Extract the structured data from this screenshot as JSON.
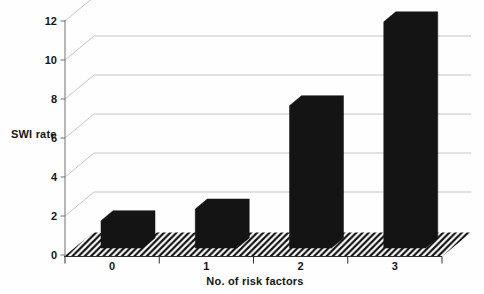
{
  "chart_data": {
    "type": "bar",
    "effect": "3d-oblique",
    "title": "",
    "xlabel": "No. of risk factors",
    "ylabel": "SWI rate",
    "categories": [
      "0",
      "1",
      "2",
      "3"
    ],
    "values": [
      1.4,
      2.0,
      7.3,
      11.6
    ],
    "ylim": [
      0,
      12
    ],
    "yticks": [
      0,
      2,
      4,
      6,
      8,
      10,
      12
    ],
    "y_tick_labels": [
      "0",
      "2",
      "4",
      "6",
      "8",
      "10",
      "12"
    ],
    "grid": "on",
    "legend": "none",
    "floor": "black-diagonal-hatch",
    "style": {
      "background": "#fefefe",
      "bar_color": "#141414",
      "gridline_color": "#c6c6c6",
      "y_axis_color": "#707070",
      "front_axis_color": "#2e2e2e",
      "hatch_color": "#111111",
      "label_color": "#161616"
    }
  }
}
